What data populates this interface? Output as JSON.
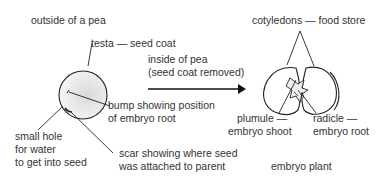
{
  "left_panel": {
    "title": "outside of a pea",
    "testa_label": "testa — seed coat",
    "bump_label_line1": "bump showing position",
    "bump_label_line2": "of embryo root",
    "hole_label_line1": "small hole",
    "hole_label_line2": "for water",
    "hole_label_line3": "to get into seed",
    "scar_label_line1": "scar showing where seed",
    "scar_label_line2": "was attached to parent"
  },
  "arrow": {
    "label_line1": "inside of pea",
    "label_line2": "(seed coat removed)"
  },
  "right_panel": {
    "cotyledons_label": "cotyledons — food store",
    "plumule_label_line1": "plumule —",
    "plumule_label_line2": "embryo shoot",
    "radicle_label_line1": "radicle —",
    "radicle_label_line2": "embryo root",
    "caption": "embryo plant"
  }
}
